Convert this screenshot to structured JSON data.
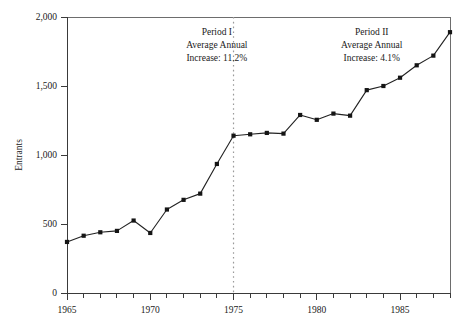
{
  "chart_data": {
    "type": "line",
    "title": "",
    "xlabel": "",
    "ylabel": "Entrants",
    "xlim": [
      1965,
      1988
    ],
    "ylim": [
      0,
      2000
    ],
    "grid": false,
    "legend": "none",
    "x": [
      1965,
      1966,
      1967,
      1968,
      1969,
      1970,
      1971,
      1972,
      1973,
      1974,
      1975,
      1976,
      1977,
      1978,
      1979,
      1980,
      1981,
      1982,
      1983,
      1984,
      1985,
      1986,
      1987,
      1988
    ],
    "values": [
      370,
      415,
      440,
      450,
      525,
      435,
      605,
      675,
      720,
      935,
      1140,
      1150,
      1160,
      1155,
      1290,
      1255,
      1300,
      1285,
      1470,
      1500,
      1560,
      1650,
      1720,
      1890
    ],
    "series": [
      {
        "name": "Entrants",
        "values": [
          370,
          415,
          440,
          450,
          525,
          435,
          605,
          675,
          720,
          935,
          1140,
          1150,
          1160,
          1155,
          1290,
          1255,
          1300,
          1285,
          1470,
          1500,
          1560,
          1650,
          1720,
          1890
        ]
      }
    ],
    "y_ticks": [
      0,
      500,
      1000,
      1500,
      2000
    ],
    "y_tick_labels": [
      "0",
      "500",
      "1,000",
      "1,500",
      "2,000"
    ],
    "x_tick_labels": [
      "1965",
      "1970",
      "1975",
      "1980",
      "1985"
    ],
    "x_tick_values": [
      1965,
      1970,
      1975,
      1980,
      1985
    ],
    "divider": {
      "value": 1975,
      "style": "dotted"
    },
    "annotations": [
      {
        "id": "period-one",
        "lines": [
          "Period I",
          "Average Annual",
          "Increase: 11.2%"
        ],
        "x": 1974.0,
        "y": 1870
      },
      {
        "id": "period-two",
        "lines": [
          "Period II",
          "Average Annual",
          "Increase: 4.1%"
        ],
        "x": 1983.3,
        "y": 1870
      }
    ],
    "colors": {
      "line": "#222222",
      "marker": "#151515",
      "axis": "#3a3a3a",
      "frame": "#6d6d6d",
      "divider": "#9a9a9a",
      "background": "#ffffff"
    }
  }
}
